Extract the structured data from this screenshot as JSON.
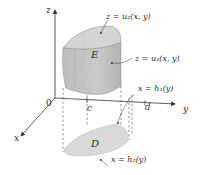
{
  "figure": {
    "axes": {
      "z_label": "z",
      "x_label": "x",
      "y_label": "y",
      "origin_label": "0"
    },
    "tick_labels": {
      "c": "c",
      "d": "d"
    },
    "regions": {
      "solid_label": "E",
      "base_label": "D"
    },
    "annotations": {
      "upper_surface": "z = u₂(x, y)",
      "lower_surface": "z = u₁(x, y)",
      "boundary_h1": "x = h₁(y)",
      "boundary_h2": "x = h₂(y)"
    },
    "colors": {
      "solid_fill": "#c4c4c4",
      "solid_top": "#d6d6d6",
      "base_fill": "#d9d9d9",
      "axis": "#333333",
      "dashed": "#555555",
      "text": "#2b2b2b"
    }
  }
}
